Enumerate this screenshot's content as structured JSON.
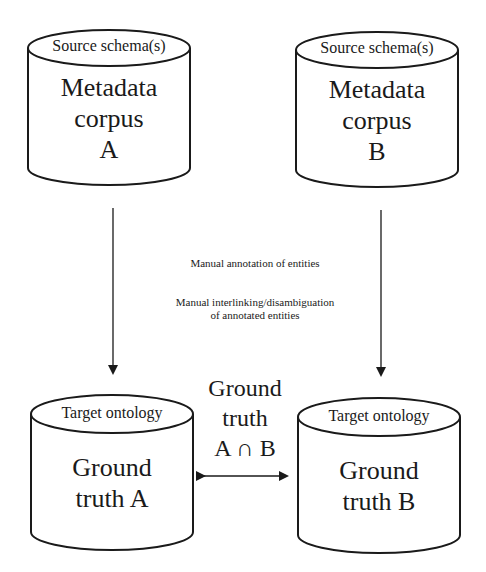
{
  "colors": {
    "stroke": "#1a1a1a",
    "background": "#ffffff",
    "text": "#1a1a1a"
  },
  "top_left": {
    "cap_label": "Source schema(s)",
    "body_lines": [
      "Metadata",
      "corpus",
      "A"
    ]
  },
  "top_right": {
    "cap_label": "Source schema(s)",
    "body_lines": [
      "Metadata",
      "corpus",
      "B"
    ]
  },
  "process": {
    "step1": "Manual annotation of entities",
    "step2_line1": "Manual interlinking/disambiguation",
    "step2_line2": "of annotated entities"
  },
  "bottom_left": {
    "cap_label": "Target ontology",
    "body_lines": [
      "Ground",
      "truth A"
    ]
  },
  "bottom_right": {
    "cap_label": "Target ontology",
    "body_lines": [
      "Ground",
      "truth B"
    ]
  },
  "intersection": {
    "lines": [
      "Ground",
      "truth",
      "A ∩ B"
    ]
  }
}
